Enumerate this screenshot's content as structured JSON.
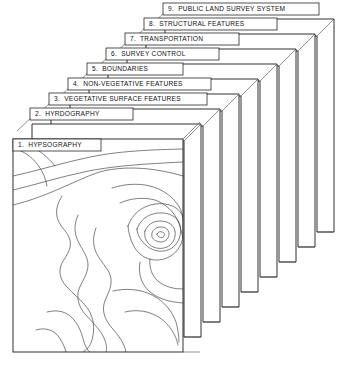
{
  "figure": {
    "layer_count": 9,
    "background_color": "#ffffff",
    "line_color": "#1a1a1a",
    "contour_color": "#3a3a3a"
  },
  "layers": [
    {
      "number": "1.",
      "name": "HYPSOGRAPHY",
      "label": "1.  HYPSOGRAPHY"
    },
    {
      "number": "2.",
      "name": "HYRDOGRAPHY",
      "label": "2.  HYRDOGRAPHY"
    },
    {
      "number": "3.",
      "name": "VEGETATIVE SURFACE FEATURES",
      "label": "3.  VEGETATIVE SURFACE FEATURES"
    },
    {
      "number": "4.",
      "name": "NON-VEGETATIVE FEATURES",
      "label": "4.  NON-VEGETATIVE FEATURES"
    },
    {
      "number": "5.",
      "name": "BOUNDARIES",
      "label": "5.  BOUNDARIES"
    },
    {
      "number": "6.",
      "name": "SURVEY CONTROL",
      "label": "6.  SURVEY CONTROL"
    },
    {
      "number": "7.",
      "name": "TRANSPORTATION",
      "label": "7.  TRANSPORTATION"
    },
    {
      "number": "8.",
      "name": "STRUCTURAL FEATURES",
      "label": "8.  STRUCTURAL FEATURES"
    },
    {
      "number": "9.",
      "name": "PUBLIC LAND SURVEY SYSTEM",
      "label": "9.  PUBLIC LAND SURVEY SYSTEM"
    }
  ],
  "front_panel": {
    "content": "topographic contour map",
    "layer_label": "1.  HYPSOGRAPHY"
  }
}
